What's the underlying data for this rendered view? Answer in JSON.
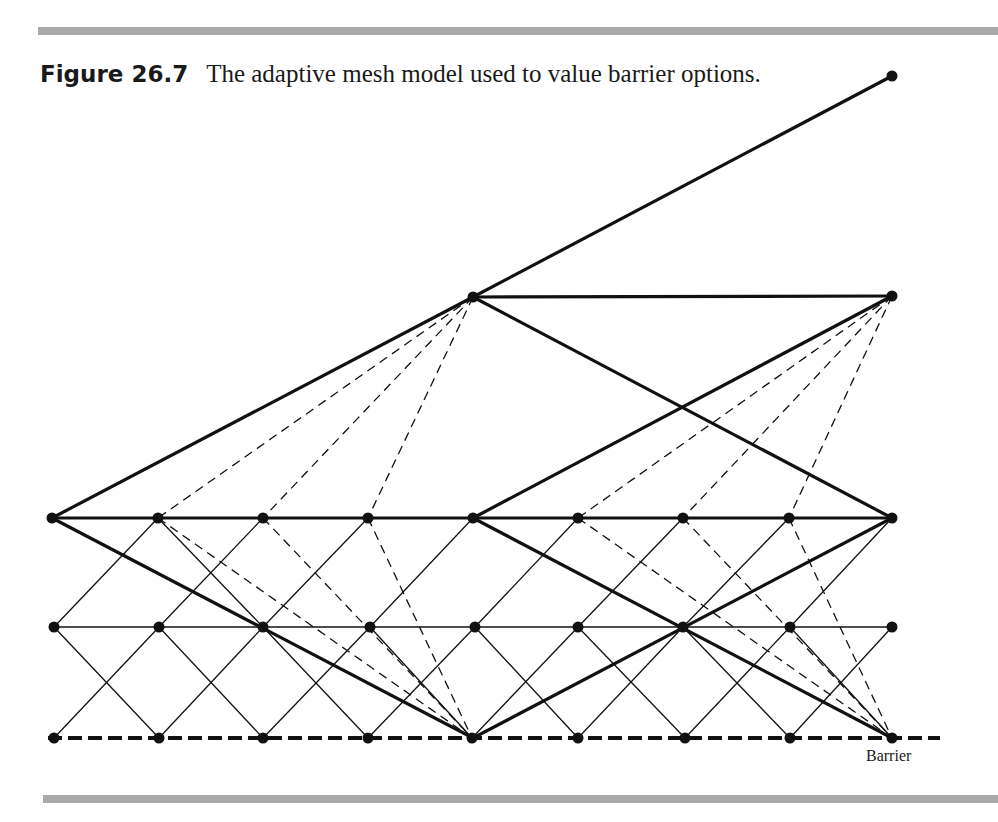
{
  "figure": {
    "label": "Figure 26.7",
    "caption": "The adaptive mesh model used to value barrier options.",
    "barrier_label": "Barrier"
  },
  "mesh": {
    "colors": {
      "ink": "#111111",
      "rule": "#a9a9a9"
    },
    "nodes": {
      "top": [
        [
          892,
          76
        ]
      ],
      "upper": [
        [
          473,
          297
        ],
        [
          892,
          296
        ]
      ],
      "main_row": {
        "y": 518,
        "x": [
          52,
          158,
          263,
          368,
          473,
          578,
          683,
          789,
          892
        ]
      },
      "middle_row": {
        "y": 627,
        "x": [
          54,
          159,
          263,
          370,
          475,
          578,
          683,
          790,
          892
        ]
      },
      "barrier_row": {
        "y": 738,
        "x": [
          54,
          159,
          263,
          368,
          472,
          578,
          685,
          790,
          892
        ]
      }
    },
    "coarse_edges": [
      [
        52,
        518,
        473,
        297
      ],
      [
        52,
        518,
        473,
        518
      ],
      [
        52,
        518,
        473,
        738
      ],
      [
        473,
        297,
        892,
        76
      ],
      [
        473,
        297,
        892,
        296
      ],
      [
        473,
        297,
        892,
        518
      ],
      [
        473,
        518,
        892,
        296
      ],
      [
        473,
        518,
        892,
        518
      ],
      [
        473,
        518,
        892,
        738
      ],
      [
        473,
        738,
        892,
        518
      ]
    ],
    "fine_edges": [
      [
        54,
        627,
        892,
        627
      ],
      [
        54,
        627,
        158,
        518
      ],
      [
        159,
        627,
        263,
        518
      ],
      [
        263,
        627,
        368,
        518
      ],
      [
        370,
        627,
        473,
        518
      ],
      [
        475,
        627,
        578,
        518
      ],
      [
        578,
        627,
        683,
        518
      ],
      [
        683,
        627,
        789,
        518
      ],
      [
        790,
        627,
        892,
        518
      ],
      [
        158,
        518,
        263,
        627
      ],
      [
        52,
        518,
        54,
        518
      ],
      [
        54,
        738,
        159,
        627
      ],
      [
        159,
        738,
        263,
        627
      ],
      [
        263,
        738,
        370,
        627
      ],
      [
        368,
        738,
        475,
        627
      ],
      [
        472,
        738,
        578,
        627
      ],
      [
        578,
        738,
        683,
        627
      ],
      [
        685,
        738,
        790,
        627
      ],
      [
        790,
        738,
        892,
        627
      ],
      [
        54,
        627,
        159,
        738
      ],
      [
        159,
        627,
        263,
        738
      ],
      [
        263,
        627,
        368,
        738
      ],
      [
        370,
        627,
        472,
        738
      ],
      [
        475,
        627,
        578,
        738
      ],
      [
        578,
        627,
        685,
        738
      ],
      [
        683,
        627,
        790,
        738
      ],
      [
        790,
        627,
        892,
        738
      ],
      [
        683,
        518,
        683,
        518
      ]
    ],
    "dashed_edges": [
      [
        473,
        297,
        158,
        518
      ],
      [
        473,
        297,
        263,
        518
      ],
      [
        473,
        297,
        368,
        518
      ],
      [
        892,
        296,
        578,
        518
      ],
      [
        892,
        296,
        683,
        518
      ],
      [
        892,
        296,
        789,
        518
      ],
      [
        158,
        518,
        472,
        738
      ],
      [
        263,
        518,
        472,
        738
      ],
      [
        368,
        518,
        472,
        738
      ],
      [
        578,
        518,
        892,
        738
      ],
      [
        683,
        518,
        892,
        738
      ],
      [
        789,
        518,
        892,
        738
      ]
    ],
    "barrier_line": [
      48,
      738,
      940,
      738
    ]
  }
}
